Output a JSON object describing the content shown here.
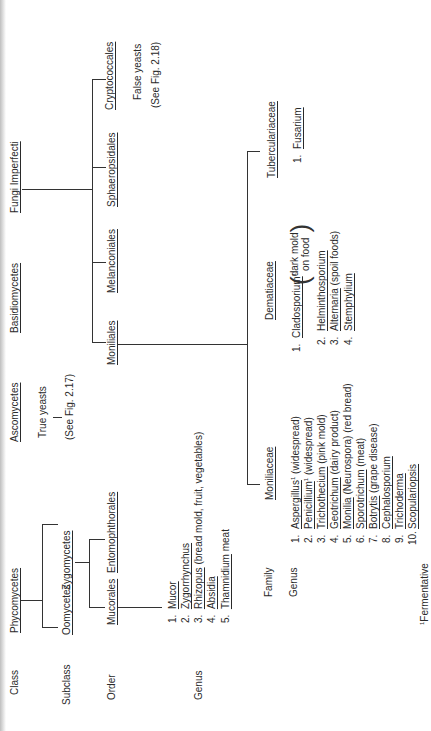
{
  "row_labels": {
    "class": "Class",
    "subclass": "Subclass",
    "order": "Order",
    "genus_left": "Genus",
    "family": "Family",
    "genus_right": "Genus"
  },
  "classes": {
    "phycomycetes": "Phycomycetes",
    "ascomycetes": "Ascomycetes",
    "basidiomycetes": "Basidiomycetes",
    "fungi_imperfecti": "Fungi Imperfecti"
  },
  "ascomycetes_note": {
    "line1": "True yeasts",
    "line2": "(See Fig. 2.17)"
  },
  "subclasses": {
    "oomycetes": "Oomycetes",
    "zygomycetes": "Zygomycetes"
  },
  "orders": {
    "mucorales": "Mucorales",
    "entomophthorales": "Entomophthorales",
    "moniliales": "Moniliales",
    "melanconiales": "Melanconiales",
    "sphaeropsidales": "Sphaeropsidales",
    "cryptococcales": "Cryptococcales"
  },
  "cryptococcales_note": {
    "line1": "False yeasts",
    "line2": "(See Fig. 2.18)"
  },
  "mucorales_genera": [
    {
      "num": "1.",
      "name": "Mucor",
      "note": ""
    },
    {
      "num": "2.",
      "name": "Zygorrhynchus",
      "note": ""
    },
    {
      "num": "3.",
      "name": "Rhizopus",
      "note": "(bread mold, fruit, vegetables)"
    },
    {
      "num": "4.",
      "name": "Absidia",
      "note": ""
    },
    {
      "num": "5.",
      "name": "Thamnidium",
      "note": "meat"
    }
  ],
  "families": {
    "moniliaceae": "Moniliaceae",
    "dematiaceae": "Dematiaceae",
    "tuberculariaceae": "Tuberculariaceae"
  },
  "moniliaceae_genera": [
    {
      "num": "1.",
      "name": "Aspergillus",
      "sup": "1",
      "note": "(widespread)"
    },
    {
      "num": "2.",
      "name": "Penicillium",
      "sup": "1",
      "note": "(widespread)"
    },
    {
      "num": "3.",
      "name": "Trichothecium",
      "sup": "",
      "note": "(pink mold)"
    },
    {
      "num": "4.",
      "name": "Geotrichum",
      "sup": "",
      "note": "(dairy product)"
    },
    {
      "num": "5.",
      "name": "Monilia",
      "sup": "",
      "note": "(Neurospora) (red bread)"
    },
    {
      "num": "6.",
      "name": "Sporotrichum",
      "sup": "",
      "note": "(meat)"
    },
    {
      "num": "7.",
      "name": "Botrytis",
      "sup": "",
      "note": "(grape disease)"
    },
    {
      "num": "8.",
      "name": "Cephalosporium",
      "sup": "",
      "note": ""
    },
    {
      "num": "9.",
      "name": "Trichoderma",
      "sup": "",
      "note": ""
    },
    {
      "num": "10.",
      "name": "Scopulariopsis",
      "sup": "",
      "note": ""
    }
  ],
  "dematiaceae_genera": [
    {
      "num": "1.",
      "name": "Cladosporium",
      "sup": "1",
      "note_line1": "dark mold",
      "note_line2": "on food"
    },
    {
      "num": "2.",
      "name": "Helminthosporium",
      "note": ""
    },
    {
      "num": "3.",
      "name": "Alternaria",
      "note": "(spoil foods)"
    },
    {
      "num": "4.",
      "name": "Stemphylium",
      "note": ""
    }
  ],
  "tuberculariaceae_genera": [
    {
      "num": "1.",
      "name": "Fusarium"
    }
  ],
  "footnote": {
    "mark": "1",
    "text": "Fermentative"
  }
}
